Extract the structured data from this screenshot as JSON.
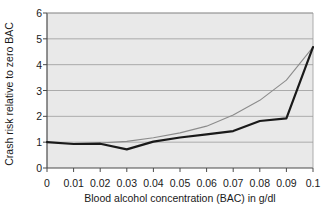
{
  "chart_data": {
    "type": "line",
    "title": "",
    "xlabel": "Blood alcohol concentration (BAC) in g/dl",
    "ylabel": "Crash risk relative to zero BAC",
    "xlim": [
      0,
      0.1
    ],
    "ylim": [
      0,
      6
    ],
    "xticks": [
      "0",
      "0.01",
      "0.02",
      "0.03",
      "0.04",
      "0.05",
      "0.06",
      "0.07",
      "0.08",
      "0.09",
      "0.1"
    ],
    "xtick_values": [
      0,
      0.01,
      0.02,
      0.03,
      0.04,
      0.05,
      0.06,
      0.07,
      0.08,
      0.09,
      0.1
    ],
    "yticks": [
      "0",
      "1",
      "2",
      "3",
      "4",
      "5",
      "6"
    ],
    "ytick_values": [
      0,
      1,
      2,
      3,
      4,
      5,
      6
    ],
    "grid": "horizontal",
    "legend": "none",
    "plot_background": "#e9e9e9",
    "x": [
      0,
      0.01,
      0.02,
      0.03,
      0.04,
      0.05,
      0.06,
      0.07,
      0.08,
      0.09,
      0.1
    ],
    "series": [
      {
        "name": "dark-curve",
        "color": "#1a1a1a",
        "width": 2.2,
        "values": [
          1.0,
          0.93,
          0.94,
          0.72,
          1.02,
          1.18,
          1.3,
          1.43,
          1.82,
          1.92,
          4.68
        ]
      },
      {
        "name": "gray-curve",
        "color": "#8c8c8c",
        "width": 1.1,
        "x": [
          0.02,
          0.03,
          0.04,
          0.05,
          0.06,
          0.07,
          0.08,
          0.09,
          0.1
        ],
        "values": [
          0.97,
          1.03,
          1.17,
          1.36,
          1.62,
          2.05,
          2.62,
          3.4,
          4.68
        ]
      }
    ]
  }
}
